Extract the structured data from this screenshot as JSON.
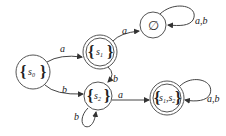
{
  "diagram": {
    "type": "dfa-state-diagram",
    "nodes": [
      {
        "id": "s0",
        "label": "{s0}",
        "set_open": "{",
        "set_close": "}",
        "name": "s",
        "sub": "0",
        "accepting": false
      },
      {
        "id": "s1",
        "label": "{s1}",
        "set_open": "{",
        "set_close": "}",
        "name": "s",
        "sub": "1",
        "accepting": true
      },
      {
        "id": "empty",
        "label": "∅",
        "accepting": false
      },
      {
        "id": "s2",
        "label": "{s2}",
        "set_open": "{",
        "set_close": "}",
        "name": "s",
        "sub": "2",
        "accepting": false
      },
      {
        "id": "s1s2",
        "label": "{s1,s2}",
        "set_open": "{",
        "set_close": "}",
        "name1": "s",
        "sub1": "1",
        "sep": ",",
        "name2": "s",
        "sub2": "2",
        "accepting": true
      }
    ],
    "edges": [
      {
        "from": "s0",
        "to": "s1",
        "label": "a"
      },
      {
        "from": "s0",
        "to": "s2",
        "label": "b"
      },
      {
        "from": "s1",
        "to": "empty",
        "label": "a"
      },
      {
        "from": "s1",
        "to": "s2",
        "label": "b"
      },
      {
        "from": "empty",
        "to": "empty",
        "label": "a,b"
      },
      {
        "from": "s2",
        "to": "s2",
        "label": "b"
      },
      {
        "from": "s2",
        "to": "s1s2",
        "label": "a"
      },
      {
        "from": "s1s2",
        "to": "s1s2",
        "label": "a,b"
      }
    ]
  }
}
